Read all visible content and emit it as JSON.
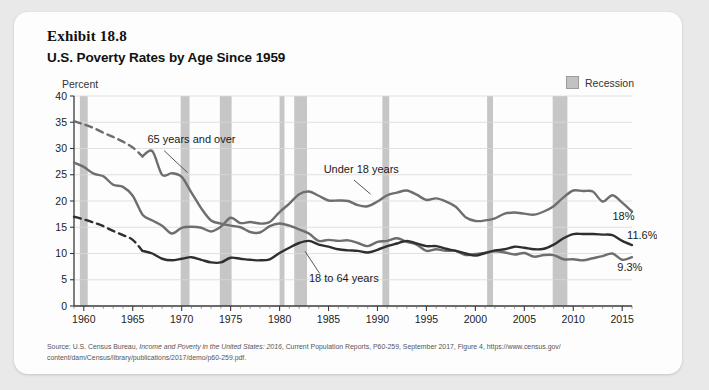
{
  "exhibit": {
    "number_label": "Exhibit 18.8",
    "title": "U.S. Poverty Rates by Age Since 1959"
  },
  "legend": {
    "recession_label": "Recession",
    "recession_color": "#c6c6c6"
  },
  "axes": {
    "y_unit_label": "Percent"
  },
  "source": {
    "line1_prefix": "Source: U.S. Census Bureau, ",
    "line1_italic": "Income and Poverty in the United States: 2016",
    "line1_suffix": ", Current Population Reports, P60-259, September 2017, Figure 4, https://www.census.gov/",
    "line2": "content/dam/Census/library/publications/2017/demo/p60-259.pdf."
  },
  "chart_data": {
    "type": "line",
    "title": "U.S. Poverty Rates by Age Since 1959",
    "xlabel": "",
    "ylabel": "Percent",
    "ylim": [
      0,
      40
    ],
    "xlim": [
      1959,
      2016
    ],
    "y_ticks": [
      0,
      5,
      10,
      15,
      20,
      25,
      30,
      35,
      40
    ],
    "x_ticks": [
      1960,
      1965,
      1970,
      1975,
      1980,
      1985,
      1990,
      1995,
      2000,
      2005,
      2010,
      2015
    ],
    "grid": true,
    "legend_position": "top-right",
    "series": [
      {
        "name": "65 years and over",
        "color": "#6e6e6e",
        "label_text": "65 years and over",
        "dashed_range": [
          1959,
          1966
        ],
        "end_label": "9.3%",
        "x": [
          1959,
          1960,
          1961,
          1962,
          1963,
          1964,
          1965,
          1966,
          1967,
          1968,
          1969,
          1970,
          1971,
          1972,
          1973,
          1974,
          1975,
          1976,
          1977,
          1978,
          1979,
          1980,
          1981,
          1982,
          1983,
          1984,
          1985,
          1986,
          1987,
          1988,
          1989,
          1990,
          1991,
          1992,
          1993,
          1994,
          1995,
          1996,
          1997,
          1998,
          1999,
          2000,
          2001,
          2002,
          2003,
          2004,
          2005,
          2006,
          2007,
          2008,
          2009,
          2010,
          2011,
          2012,
          2013,
          2014,
          2015,
          2016
        ],
        "values": [
          35.2,
          34.6,
          33.9,
          33.0,
          32.2,
          31.3,
          30.2,
          28.5,
          29.5,
          25.0,
          25.3,
          24.6,
          21.6,
          18.6,
          16.3,
          15.7,
          15.3,
          15.0,
          14.1,
          14.0,
          15.2,
          15.7,
          15.3,
          14.6,
          13.8,
          12.4,
          12.6,
          12.4,
          12.5,
          12.0,
          11.4,
          12.2,
          12.4,
          12.9,
          12.2,
          11.7,
          10.5,
          10.8,
          10.5,
          10.5,
          9.7,
          9.9,
          10.1,
          10.4,
          10.2,
          9.8,
          10.1,
          9.4,
          9.7,
          9.7,
          8.9,
          8.9,
          8.7,
          9.1,
          9.5,
          10.0,
          8.8,
          9.3
        ]
      },
      {
        "name": "Under 18 years",
        "color": "#6e6e6e",
        "label_text": "Under 18 years",
        "dashed_range": null,
        "end_label": "18%",
        "x": [
          1959,
          1960,
          1961,
          1962,
          1963,
          1964,
          1965,
          1966,
          1967,
          1968,
          1969,
          1970,
          1971,
          1972,
          1973,
          1974,
          1975,
          1976,
          1977,
          1978,
          1979,
          1980,
          1981,
          1982,
          1983,
          1984,
          1985,
          1986,
          1987,
          1988,
          1989,
          1990,
          1991,
          1992,
          1993,
          1994,
          1995,
          1996,
          1997,
          1998,
          1999,
          2000,
          2001,
          2002,
          2003,
          2004,
          2005,
          2006,
          2007,
          2008,
          2009,
          2010,
          2011,
          2012,
          2013,
          2014,
          2015,
          2016
        ],
        "values": [
          27.3,
          26.5,
          25.2,
          24.7,
          23.1,
          22.7,
          21.0,
          17.4,
          16.3,
          15.3,
          13.8,
          14.9,
          15.1,
          14.9,
          14.2,
          15.1,
          16.8,
          15.8,
          16.0,
          15.7,
          16.0,
          17.9,
          19.5,
          21.3,
          21.8,
          21.0,
          20.1,
          20.1,
          20.0,
          19.2,
          19.0,
          19.9,
          21.1,
          21.6,
          22.0,
          21.2,
          20.2,
          20.5,
          19.9,
          18.9,
          16.9,
          16.2,
          16.3,
          16.7,
          17.6,
          17.8,
          17.6,
          17.4,
          18.0,
          19.0,
          20.7,
          22.0,
          21.9,
          21.8,
          19.9,
          21.1,
          19.7,
          18.0
        ]
      },
      {
        "name": "18 to 64 years",
        "color": "#2f2f2f",
        "label_text": "18 to 64 years",
        "dashed_range": [
          1959,
          1966
        ],
        "end_label": "11.6%",
        "x": [
          1959,
          1960,
          1961,
          1962,
          1963,
          1964,
          1965,
          1966,
          1967,
          1968,
          1969,
          1970,
          1971,
          1972,
          1973,
          1974,
          1975,
          1976,
          1977,
          1978,
          1979,
          1980,
          1981,
          1982,
          1983,
          1984,
          1985,
          1986,
          1987,
          1988,
          1989,
          1990,
          1991,
          1992,
          1993,
          1994,
          1995,
          1996,
          1997,
          1998,
          1999,
          2000,
          2001,
          2002,
          2003,
          2004,
          2005,
          2006,
          2007,
          2008,
          2009,
          2010,
          2011,
          2012,
          2013,
          2014,
          2015,
          2016
        ],
        "values": [
          17.0,
          16.5,
          15.9,
          15.2,
          14.3,
          13.5,
          12.6,
          10.5,
          10.0,
          9.0,
          8.7,
          9.0,
          9.3,
          8.8,
          8.3,
          8.3,
          9.2,
          9.0,
          8.8,
          8.7,
          8.9,
          10.1,
          11.1,
          12.0,
          12.4,
          11.7,
          11.3,
          10.8,
          10.6,
          10.5,
          10.2,
          10.7,
          11.4,
          11.9,
          12.4,
          11.9,
          11.4,
          11.4,
          10.9,
          10.5,
          10.0,
          9.6,
          10.1,
          10.6,
          10.8,
          11.3,
          11.1,
          10.8,
          10.9,
          11.7,
          12.9,
          13.7,
          13.7,
          13.7,
          13.6,
          13.5,
          12.4,
          11.6
        ]
      }
    ],
    "recession_bands": [
      {
        "start": 1959.6,
        "end": 1960.4
      },
      {
        "start": 1969.9,
        "end": 1970.8
      },
      {
        "start": 1973.9,
        "end": 1975.1
      },
      {
        "start": 1980.0,
        "end": 1980.5
      },
      {
        "start": 1981.5,
        "end": 1982.8
      },
      {
        "start": 1990.5,
        "end": 1991.2
      },
      {
        "start": 2001.2,
        "end": 2001.8
      },
      {
        "start": 2007.9,
        "end": 2009.4
      }
    ],
    "annotations": [
      {
        "text": "65 years and over",
        "x": 1966.5,
        "y": 31.0
      },
      {
        "text": "Under 18 years",
        "x": 1984.5,
        "y": 25.4
      },
      {
        "text": "18 to 64 years",
        "x": 1983.0,
        "y": 4.6
      },
      {
        "text": "18%",
        "x": 2014.0,
        "y": 16.3
      },
      {
        "text": "11.6%",
        "x": 2015.5,
        "y": 12.7
      },
      {
        "text": "9.3%",
        "x": 2014.5,
        "y": 6.7
      }
    ]
  }
}
